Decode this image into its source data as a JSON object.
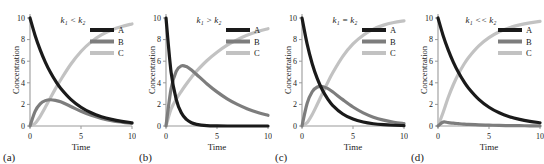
{
  "figure": {
    "axis": {
      "xlabel": "Time",
      "ylabel": "Concentration",
      "xticks": [
        "0",
        "5",
        "10"
      ],
      "yticks": [
        "0",
        "2",
        "4",
        "6",
        "8",
        "10"
      ],
      "xlim": [
        0,
        10
      ],
      "ylim": [
        0,
        10
      ]
    },
    "legend": {
      "entries": [
        {
          "label": "A",
          "color": "#1a1a1a"
        },
        {
          "label": "B",
          "color": "#7d7d7d"
        },
        {
          "label": "C",
          "color": "#c2c2c2"
        }
      ]
    },
    "panels": [
      {
        "id": "a",
        "label": "(a)",
        "annotation": "k₁ < k₂",
        "k1": 0.35,
        "k2": 1.4
      },
      {
        "id": "b",
        "label": "(b)",
        "annotation": "k₁ > k₂",
        "k1": 1.4,
        "k2": 0.35
      },
      {
        "id": "c",
        "label": "(c)",
        "annotation": "k₁ = k₂",
        "k1": 0.55,
        "k2": 0.55
      },
      {
        "id": "d",
        "label": "(d)",
        "annotation": "k₁ << k₂",
        "k1": 0.35,
        "k2": 8.0
      }
    ]
  },
  "chart_data": {
    "type": "line",
    "title": "",
    "xlabel": "Time",
    "ylabel": "Concentration",
    "xlim": [
      0,
      10
    ],
    "ylim": [
      0,
      10
    ],
    "grid": false,
    "legend_position": "upper right",
    "panel_count": 4,
    "model": "consecutive first-order reaction A -> B -> C, [A]0 = 10",
    "panels": [
      {
        "id": "a",
        "label": "(a)",
        "annotation": "k₁ < k₂",
        "k1": 0.35,
        "k2": 1.4,
        "x": [
          0,
          0.5,
          1,
          1.5,
          2,
          2.5,
          3,
          4,
          5,
          6,
          7,
          8,
          9,
          10
        ],
        "series": [
          {
            "name": "A",
            "color": "#1a1a1a",
            "values": [
              10.0,
              8.39,
              7.05,
              5.92,
              4.97,
              4.17,
              3.5,
              2.47,
              1.74,
              1.22,
              0.86,
              0.61,
              0.43,
              0.3
            ]
          },
          {
            "name": "B",
            "color": "#7d7d7d",
            "values": [
              0.0,
              1.36,
              2.05,
              2.35,
              2.43,
              2.37,
              2.24,
              1.81,
              1.36,
              0.99,
              0.71,
              0.5,
              0.36,
              0.25
            ]
          },
          {
            "name": "C",
            "color": "#c2c2c2",
            "values": [
              0.0,
              0.25,
              0.9,
              1.73,
              2.6,
              3.46,
              4.26,
              5.72,
              6.9,
              7.79,
              8.43,
              8.89,
              9.21,
              9.45
            ]
          }
        ],
        "notes": "B rises to a low maximum of about 2.4 near t = 2, then decays; C is sigmoidal approaching 10."
      },
      {
        "id": "b",
        "label": "(b)",
        "annotation": "k₁ > k₂",
        "k1": 1.4,
        "k2": 0.35,
        "x": [
          0,
          0.5,
          1,
          1.5,
          2,
          2.5,
          3,
          4,
          5,
          6,
          7,
          8,
          9,
          10
        ],
        "series": [
          {
            "name": "A",
            "color": "#1a1a1a",
            "values": [
              10.0,
              4.97,
              2.47,
              1.22,
              0.61,
              0.3,
              0.15,
              0.04,
              0.01,
              0.0,
              0.0,
              0.0,
              0.0,
              0.0
            ]
          },
          {
            "name": "B",
            "color": "#7d7d7d",
            "values": [
              0.0,
              3.46,
              5.06,
              5.57,
              5.5,
              5.18,
              4.77,
              3.92,
              3.16,
              2.52,
              2.0,
              1.58,
              1.25,
              0.99
            ]
          },
          {
            "name": "C",
            "color": "#c2c2c2",
            "values": [
              0.0,
              1.57,
              2.47,
              3.21,
              3.89,
              4.52,
              5.08,
              6.04,
              6.83,
              7.48,
              8.0,
              8.42,
              8.75,
              9.01
            ]
          }
        ],
        "notes": "A falls steeply; B peaks at about 5.5 near t = 1.6 and decays slowly; C rises gradually to near 9."
      },
      {
        "id": "c",
        "label": "(c)",
        "annotation": "k₁ = k₂",
        "k1": 0.55,
        "k2": 0.55,
        "x": [
          0,
          0.5,
          1,
          1.5,
          2,
          2.5,
          3,
          4,
          5,
          6,
          7,
          8,
          9,
          10
        ],
        "series": [
          {
            "name": "A",
            "color": "#1a1a1a",
            "values": [
              10.0,
              7.6,
              5.77,
              4.38,
              3.33,
              2.53,
              1.92,
              1.11,
              0.64,
              0.37,
              0.21,
              0.12,
              0.07,
              0.04
            ]
          },
          {
            "name": "B",
            "color": "#7d7d7d",
            "values": [
              0.0,
              2.09,
              3.17,
              3.61,
              3.66,
              3.48,
              3.17,
              2.44,
              1.76,
              1.22,
              0.82,
              0.54,
              0.35,
              0.22
            ]
          },
          {
            "name": "C",
            "color": "#c2c2c2",
            "values": [
              0.0,
              0.31,
              1.06,
              2.01,
              3.01,
              3.99,
              4.91,
              6.45,
              7.6,
              8.41,
              8.97,
              9.34,
              9.58,
              9.74
            ]
          }
        ],
        "notes": "A and B cross near t = 2 at about 3.6, which is also the B maximum; C approaches 10."
      },
      {
        "id": "d",
        "label": "(d)",
        "annotation": "k₁ << k₂",
        "k1": 0.35,
        "k2": 8.0,
        "x": [
          0,
          0.5,
          1,
          1.5,
          2,
          2.5,
          3,
          4,
          5,
          6,
          7,
          8,
          9,
          10
        ],
        "series": [
          {
            "name": "A",
            "color": "#1a1a1a",
            "values": [
              10.0,
              8.39,
              7.05,
              5.92,
              4.97,
              4.17,
              3.5,
              2.47,
              1.74,
              1.22,
              0.86,
              0.61,
              0.43,
              0.3
            ]
          },
          {
            "name": "B",
            "color": "#7d7d7d",
            "values": [
              0.0,
              0.36,
              0.31,
              0.26,
              0.22,
              0.18,
              0.15,
              0.11,
              0.08,
              0.05,
              0.04,
              0.03,
              0.02,
              0.01
            ]
          },
          {
            "name": "C",
            "color": "#c2c2c2",
            "values": [
              0.0,
              1.25,
              2.64,
              3.82,
              4.81,
              5.65,
              6.35,
              7.42,
              8.18,
              8.73,
              9.1,
              9.36,
              9.55,
              9.69
            ]
          }
        ],
        "notes": "B is essentially flat at a very small steady-state value below 0.5; A decays and C rises as mirror images crossing near 5."
      }
    ]
  }
}
